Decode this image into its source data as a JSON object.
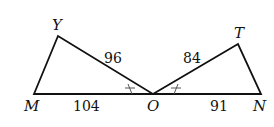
{
  "diagram": {
    "points": {
      "M": {
        "label": "M"
      },
      "Y": {
        "label": "Y"
      },
      "O": {
        "label": "O"
      },
      "T": {
        "label": "T"
      },
      "N": {
        "label": "N"
      }
    },
    "segments": {
      "YO": "96",
      "TO": "84",
      "MO": "104",
      "ON": "91"
    },
    "line_color": "#111111"
  }
}
